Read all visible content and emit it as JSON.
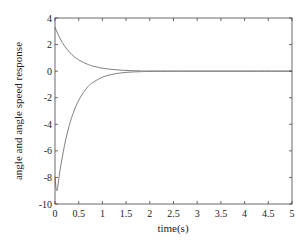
{
  "chart_data": {
    "type": "line",
    "title": "",
    "xlabel": "time(s)",
    "ylabel": "angle and angle speed response",
    "xlim": [
      0,
      5
    ],
    "ylim": [
      -10,
      4
    ],
    "xticks": [
      0,
      0.5,
      1,
      1.5,
      2,
      2.5,
      3,
      3.5,
      4,
      4.5,
      5
    ],
    "xtick_labels": [
      "0",
      "0.5",
      "1",
      "1.5",
      "2",
      "2.5",
      "3",
      "3.5",
      "4",
      "4.5",
      "5"
    ],
    "yticks": [
      4,
      2,
      0,
      -2,
      -4,
      -6,
      -8,
      -10
    ],
    "ytick_labels": [
      "4",
      "2",
      "0",
      "-2",
      "-4",
      "-6",
      "-8",
      "-10"
    ],
    "grid": false,
    "legend": null,
    "line_color": "#808080",
    "series": [
      {
        "name": "angle",
        "x": [
          0,
          0.1,
          0.2,
          0.3,
          0.4,
          0.5,
          0.6,
          0.7,
          0.8,
          1.0,
          1.2,
          1.4,
          1.6,
          1.8,
          2.0,
          2.5,
          3,
          4,
          5
        ],
        "y": [
          3.3,
          2.5,
          1.9,
          1.45,
          1.1,
          0.85,
          0.65,
          0.5,
          0.38,
          0.22,
          0.13,
          0.07,
          0.04,
          0.02,
          0.01,
          0,
          0,
          0,
          0
        ]
      },
      {
        "name": "angle speed",
        "x": [
          0,
          0.04,
          0.1,
          0.2,
          0.3,
          0.4,
          0.5,
          0.6,
          0.7,
          0.8,
          1.0,
          1.2,
          1.4,
          1.6,
          1.8,
          2.0,
          2.5,
          3,
          4,
          5
        ],
        "y": [
          -8.0,
          -9.0,
          -7.6,
          -5.6,
          -4.1,
          -3.0,
          -2.2,
          -1.6,
          -1.15,
          -0.85,
          -0.45,
          -0.25,
          -0.13,
          -0.07,
          -0.04,
          -0.02,
          0,
          0,
          0,
          0
        ]
      }
    ]
  }
}
